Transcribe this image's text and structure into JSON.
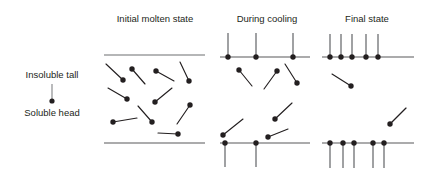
{
  "figure": {
    "width": 423,
    "height": 174,
    "background": "#ffffff",
    "ink_color": "#231f20",
    "surface_color": "#6d6e71",
    "tail_color": "#808285"
  },
  "legend": {
    "name": "amphiphile-schematic-legend",
    "tail_label": "Insoluble tall",
    "head_label": "Soluble head",
    "tail_label_pos": {
      "x": 52,
      "y": 78
    },
    "head_label_pos": {
      "x": 52,
      "y": 116
    },
    "stem": {
      "x1": 52,
      "y1": 84,
      "x2": 52,
      "y2": 100
    },
    "head_dot": {
      "cx": 52,
      "cy": 101,
      "r": 2.6
    }
  },
  "panels": [
    {
      "id": "initial-molten-state",
      "title": "Initial molten state",
      "title_pos": {
        "x": 155,
        "y": 22
      },
      "top_line": {
        "x1": 104,
        "y1": 55,
        "x2": 205,
        "y2": 55,
        "style": "light"
      },
      "bottom_line": {
        "x1": 104,
        "y1": 143,
        "x2": 205,
        "y2": 143,
        "style": "dark"
      },
      "anchored_top": [],
      "anchored_bottom": [],
      "free_molecules": [
        {
          "hx": 123,
          "hy": 80,
          "tx": 106,
          "ty": 64
        },
        {
          "hx": 132,
          "hy": 69,
          "tx": 145,
          "ty": 84
        },
        {
          "hx": 156,
          "hy": 71,
          "tx": 174,
          "ty": 81
        },
        {
          "hx": 189,
          "hy": 81,
          "tx": 180,
          "ty": 62
        },
        {
          "hx": 127,
          "hy": 99,
          "tx": 108,
          "ty": 88
        },
        {
          "hx": 155,
          "hy": 102,
          "tx": 172,
          "ty": 88
        },
        {
          "hx": 190,
          "hy": 105,
          "tx": 177,
          "ty": 124
        },
        {
          "hx": 113,
          "hy": 122,
          "tx": 137,
          "ty": 118
        },
        {
          "hx": 152,
          "hy": 122,
          "tx": 138,
          "ty": 106
        },
        {
          "hx": 178,
          "hy": 134,
          "tx": 158,
          "ty": 133
        }
      ]
    },
    {
      "id": "during-cooling",
      "title": "During cooling",
      "title_pos": {
        "x": 267,
        "y": 22
      },
      "top_line": {
        "x1": 220,
        "y1": 57,
        "x2": 310,
        "y2": 57,
        "style": "dark"
      },
      "bottom_line": {
        "x1": 220,
        "y1": 143,
        "x2": 310,
        "y2": 143,
        "style": "dark"
      },
      "anchored_top": [
        {
          "x": 228,
          "tail_length": 24
        },
        {
          "x": 256,
          "tail_length": 24
        },
        {
          "x": 293,
          "tail_length": 24
        }
      ],
      "anchored_bottom": [
        {
          "x": 225,
          "tail_length": 24
        },
        {
          "x": 256,
          "tail_length": 24
        }
      ],
      "free_molecules": [
        {
          "hx": 239,
          "hy": 70,
          "tx": 252,
          "ty": 86
        },
        {
          "hx": 277,
          "hy": 71,
          "tx": 264,
          "ty": 89
        },
        {
          "hx": 297,
          "hy": 83,
          "tx": 285,
          "ty": 64
        },
        {
          "hx": 275,
          "hy": 119,
          "tx": 292,
          "ty": 103
        },
        {
          "hx": 223,
          "hy": 135,
          "tx": 243,
          "ty": 119
        },
        {
          "hx": 268,
          "hy": 137,
          "tx": 288,
          "ty": 129
        }
      ]
    },
    {
      "id": "final-state",
      "title": "Final state",
      "title_pos": {
        "x": 367,
        "y": 22
      },
      "top_line": {
        "x1": 322,
        "y1": 57,
        "x2": 414,
        "y2": 57,
        "style": "dark"
      },
      "bottom_line": {
        "x1": 322,
        "y1": 143,
        "x2": 414,
        "y2": 143,
        "style": "dark"
      },
      "anchored_top": [
        {
          "x": 330,
          "tail_length": 23
        },
        {
          "x": 341,
          "tail_length": 23
        },
        {
          "x": 352,
          "tail_length": 23
        },
        {
          "x": 366,
          "tail_length": 23
        },
        {
          "x": 378,
          "tail_length": 23
        }
      ],
      "anchored_bottom": [
        {
          "x": 330,
          "tail_length": 25
        },
        {
          "x": 343,
          "tail_length": 25
        },
        {
          "x": 354,
          "tail_length": 25
        },
        {
          "x": 373,
          "tail_length": 25
        },
        {
          "x": 384,
          "tail_length": 25
        }
      ],
      "free_molecules": [
        {
          "hx": 351,
          "hy": 86,
          "tx": 332,
          "ty": 74
        },
        {
          "hx": 390,
          "hy": 124,
          "tx": 406,
          "ty": 108
        }
      ]
    }
  ],
  "style_constants": {
    "head_radius": 2.7,
    "title_font_size": 9.5,
    "legend_font_size": 9.5
  }
}
